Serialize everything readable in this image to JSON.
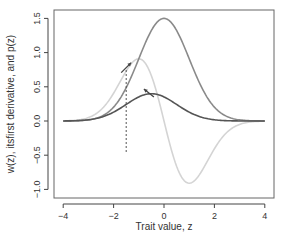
{
  "chart_data": {
    "type": "line",
    "title": "",
    "xlabel": "Trait value, z",
    "ylabel": "w(z), itsfirst derivative, and p(z)",
    "xlim": [
      -4.4,
      4.35
    ],
    "ylim": [
      -1.1,
      1.6
    ],
    "x_ticks": [
      -4,
      -2,
      0,
      2,
      4
    ],
    "x_tick_labels": [
      "−4",
      "−2",
      "0",
      "2",
      "4"
    ],
    "y_ticks": [
      1.5,
      1.0,
      0.5,
      0.0,
      -0.5,
      -1.0
    ],
    "y_tick_labels": [
      "1.5",
      "1.0",
      "0.5",
      "0.0",
      "−0.5",
      "−1.0"
    ],
    "grid": false,
    "legend": null,
    "series": [
      {
        "name": "w(z)",
        "color": "#8a8a8a",
        "x": [
          -4,
          -3.5,
          -3,
          -2.5,
          -2,
          -1.5,
          -1,
          -0.5,
          0,
          0.5,
          1,
          1.5,
          2,
          2.5,
          3,
          3.5,
          4
        ],
        "values": [
          0.0005,
          0.0033,
          0.0167,
          0.0659,
          0.203,
          0.487,
          0.91,
          1.324,
          1.5,
          1.324,
          0.91,
          0.487,
          0.203,
          0.0659,
          0.0167,
          0.0033,
          0.0005
        ]
      },
      {
        "name": "first derivative of w(z)",
        "color": "#d4d4d4",
        "x": [
          -4,
          -3.5,
          -3,
          -2.5,
          -2,
          -1.5,
          -1,
          -0.5,
          0,
          0.5,
          1,
          1.5,
          2,
          2.5,
          3,
          3.5,
          3.0
        ],
        "values": [
          0.002,
          0.0115,
          0.05,
          0.165,
          0.406,
          0.731,
          0.91,
          0.662,
          0.0,
          -0.662,
          -0.91,
          -0.731,
          -0.406,
          -0.165,
          -0.05,
          -0.0115,
          -0.05
        ]
      },
      {
        "name": "p(z)",
        "color": "#555555",
        "x": [
          -4,
          -3.5,
          -3,
          -2.5,
          -2,
          -1.5,
          -1,
          -0.5,
          0,
          0.5,
          1,
          1.5,
          2,
          2.5,
          3,
          3.5,
          4
        ],
        "values": [
          0.0009,
          0.0044,
          0.0175,
          0.054,
          0.13,
          0.242,
          0.352,
          0.399,
          0.352,
          0.242,
          0.13,
          0.054,
          0.0175,
          0.0044,
          0.0009,
          0.0001,
          0.0
        ]
      }
    ],
    "annotations": [
      {
        "type": "dashed-vline",
        "x": -1.5,
        "y_from": 0.0,
        "y_to": 0.75,
        "color": "#555555"
      },
      {
        "type": "arrow",
        "at_x": -1.5,
        "at_y": 0.78,
        "direction": "up-right",
        "color": "#444444"
      },
      {
        "type": "arrow",
        "at_x": -0.6,
        "at_y": 0.41,
        "direction": "up-left",
        "color": "#444444"
      }
    ]
  }
}
